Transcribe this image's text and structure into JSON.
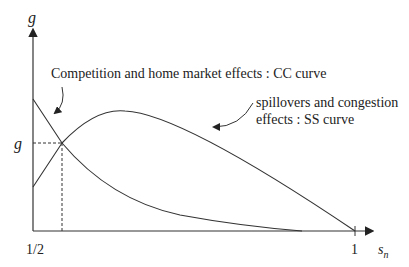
{
  "diagram": {
    "y_axis_label": "g",
    "x_axis_label_main": "s",
    "x_axis_label_sub": "n",
    "x_tick_start": "1/2",
    "x_tick_end": "1",
    "equilibrium_label": "g",
    "annotations": {
      "cc": "Competition and home market effects : CC curve",
      "ss_line1": "spillovers and congestion",
      "ss_line2": "effects : SS curve"
    },
    "colors": {
      "line": "#333333",
      "background": "#ffffff"
    }
  }
}
